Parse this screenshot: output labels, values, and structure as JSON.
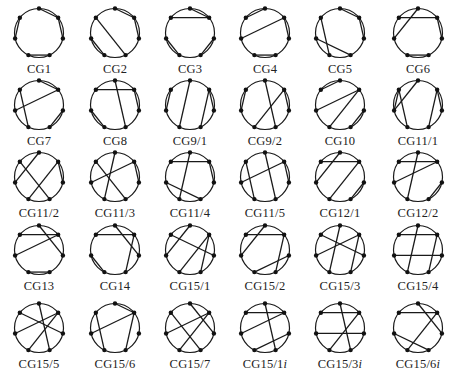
{
  "figure": {
    "columns": 6,
    "rows": 5,
    "node_angles_deg": [
      0,
      51.4,
      102.9,
      154.3,
      205.7,
      257.1,
      308.6
    ],
    "colors": {
      "stroke": "#1a1a1a",
      "node": "#111111",
      "text": "#222222",
      "background": "#ffffff"
    },
    "graphs": [
      {
        "label": "CG1",
        "chords": [
          [
            0,
            1
          ],
          [
            1,
            2
          ],
          [
            3,
            4
          ],
          [
            5,
            6
          ]
        ]
      },
      {
        "label": "CG2",
        "chords": [
          [
            0,
            1
          ],
          [
            1,
            2
          ],
          [
            6,
            3
          ],
          [
            4,
            5
          ]
        ]
      },
      {
        "label": "CG3",
        "chords": [
          [
            6,
            1
          ],
          [
            0,
            1
          ],
          [
            2,
            3
          ],
          [
            4,
            5
          ]
        ]
      },
      {
        "label": "CG4",
        "chords": [
          [
            6,
            0
          ],
          [
            1,
            2
          ],
          [
            5,
            1
          ],
          [
            3,
            4
          ]
        ]
      },
      {
        "label": "CG5",
        "chords": [
          [
            6,
            4
          ],
          [
            5,
            3
          ],
          [
            0,
            1
          ],
          [
            1,
            2
          ]
        ]
      },
      {
        "label": "CG6",
        "chords": [
          [
            6,
            1
          ],
          [
            0,
            5
          ],
          [
            1,
            2
          ],
          [
            3,
            4
          ]
        ]
      },
      {
        "label": "CG7",
        "chords": [
          [
            0,
            1
          ],
          [
            1,
            5
          ],
          [
            6,
            4
          ],
          [
            2,
            3
          ]
        ]
      },
      {
        "label": "CG8",
        "chords": [
          [
            6,
            1
          ],
          [
            0,
            3
          ],
          [
            1,
            2
          ],
          [
            5,
            4
          ]
        ]
      },
      {
        "label": "CG9/1",
        "chords": [
          [
            0,
            4
          ],
          [
            1,
            3
          ],
          [
            6,
            5
          ],
          [
            1,
            2
          ]
        ]
      },
      {
        "label": "CG9/2",
        "chords": [
          [
            0,
            3
          ],
          [
            1,
            4
          ],
          [
            6,
            5
          ],
          [
            1,
            2
          ]
        ]
      },
      {
        "label": "CG10",
        "chords": [
          [
            6,
            0
          ],
          [
            1,
            5
          ],
          [
            1,
            4
          ],
          [
            2,
            3
          ]
        ]
      },
      {
        "label": "CG11/1",
        "chords": [
          [
            6,
            5
          ],
          [
            0,
            5
          ],
          [
            6,
            4
          ],
          [
            1,
            3
          ],
          [
            1,
            2
          ]
        ]
      },
      {
        "label": "CG11/2",
        "chords": [
          [
            6,
            3
          ],
          [
            0,
            5
          ],
          [
            1,
            4
          ],
          [
            1,
            2
          ]
        ]
      },
      {
        "label": "CG11/3",
        "chords": [
          [
            0,
            4
          ],
          [
            1,
            5
          ],
          [
            6,
            3
          ],
          [
            1,
            2
          ]
        ]
      },
      {
        "label": "CG11/4",
        "chords": [
          [
            6,
            1
          ],
          [
            0,
            4
          ],
          [
            5,
            3
          ],
          [
            1,
            2
          ]
        ]
      },
      {
        "label": "CG11/5",
        "chords": [
          [
            6,
            4
          ],
          [
            0,
            3
          ],
          [
            1,
            5
          ],
          [
            1,
            2
          ]
        ]
      },
      {
        "label": "CG12/1",
        "chords": [
          [
            6,
            1
          ],
          [
            0,
            5
          ],
          [
            1,
            4
          ],
          [
            2,
            3
          ]
        ]
      },
      {
        "label": "CG12/2",
        "chords": [
          [
            6,
            1
          ],
          [
            0,
            4
          ],
          [
            1,
            5
          ],
          [
            2,
            3
          ]
        ]
      },
      {
        "label": "CG13",
        "chords": [
          [
            6,
            1
          ],
          [
            0,
            2
          ],
          [
            1,
            5
          ],
          [
            3,
            4
          ]
        ]
      },
      {
        "label": "CG14",
        "chords": [
          [
            6,
            1
          ],
          [
            0,
            2
          ],
          [
            1,
            3
          ],
          [
            5,
            4
          ]
        ]
      },
      {
        "label": "CG15/1",
        "chords": [
          [
            6,
            2
          ],
          [
            0,
            5
          ],
          [
            1,
            4
          ],
          [
            1,
            3
          ]
        ]
      },
      {
        "label": "CG15/2",
        "chords": [
          [
            6,
            1
          ],
          [
            0,
            5
          ],
          [
            1,
            3
          ],
          [
            2,
            4
          ]
        ]
      },
      {
        "label": "CG15/3",
        "chords": [
          [
            6,
            2
          ],
          [
            0,
            4
          ],
          [
            1,
            5
          ],
          [
            1,
            3
          ]
        ]
      },
      {
        "label": "CG15/4",
        "chords": [
          [
            6,
            1
          ],
          [
            0,
            4
          ],
          [
            5,
            2
          ],
          [
            1,
            3
          ]
        ]
      },
      {
        "label": "CG15/5",
        "chords": [
          [
            6,
            2
          ],
          [
            0,
            3
          ],
          [
            1,
            5
          ],
          [
            1,
            4
          ]
        ]
      },
      {
        "label": "CG15/6",
        "chords": [
          [
            0,
            1
          ],
          [
            6,
            4
          ],
          [
            1,
            5
          ],
          [
            1,
            3
          ]
        ]
      },
      {
        "label": "CG15/7",
        "chords": [
          [
            6,
            3
          ],
          [
            0,
            2
          ],
          [
            1,
            5
          ],
          [
            1,
            4
          ]
        ]
      },
      {
        "label": "CG15/1i",
        "label_main": "CG15/1",
        "label_suffix": "i",
        "chords": [
          [
            6,
            1
          ],
          [
            0,
            3
          ],
          [
            1,
            5
          ],
          [
            2,
            4
          ]
        ]
      },
      {
        "label": "CG15/3i",
        "label_main": "CG15/3",
        "label_suffix": "i",
        "chords": [
          [
            6,
            1
          ],
          [
            0,
            3
          ],
          [
            1,
            4
          ],
          [
            5,
            2
          ]
        ]
      },
      {
        "label": "CG15/6i",
        "label_main": "CG15/6",
        "label_suffix": "i",
        "chords": [
          [
            6,
            1
          ],
          [
            0,
            2
          ],
          [
            1,
            4
          ],
          [
            5,
            3
          ]
        ]
      }
    ]
  }
}
